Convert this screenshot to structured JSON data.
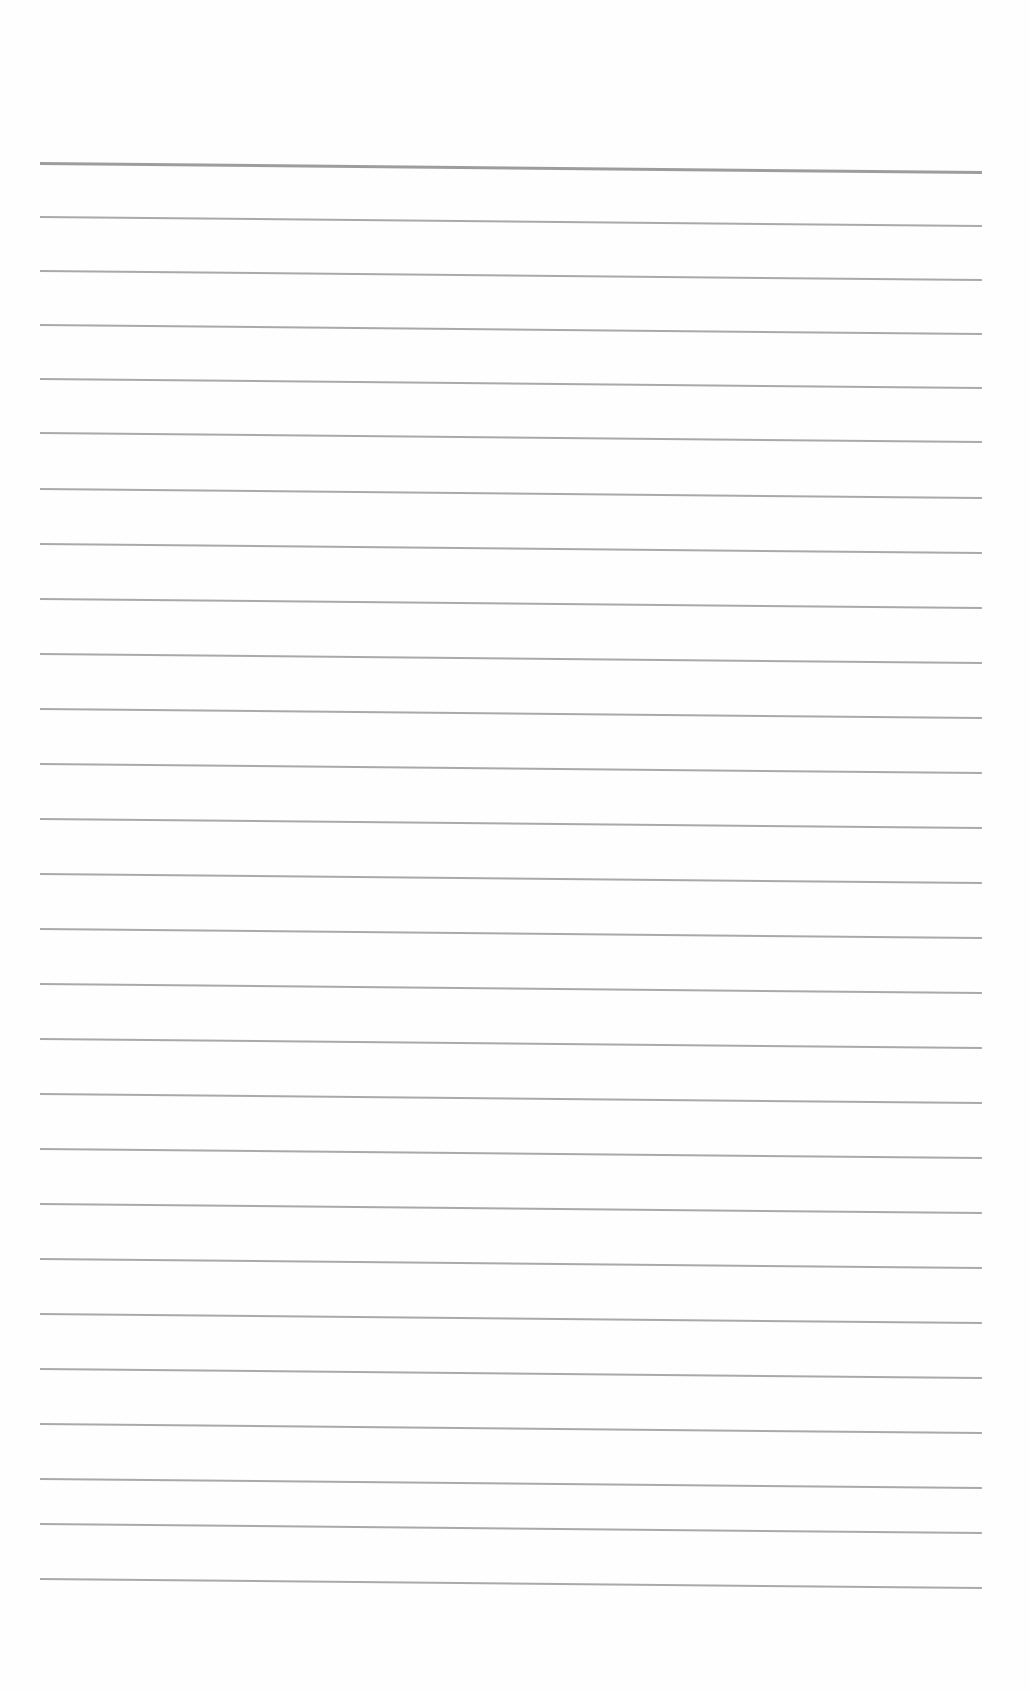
{
  "page": {
    "type": "blank lined paper",
    "background_color": "#fefefe",
    "line_color": "#9a9a9a",
    "line_count": 27,
    "line_y_positions": [
      162,
      216,
      270,
      324,
      378,
      432,
      488,
      543,
      598,
      653,
      708,
      763,
      818,
      873,
      928,
      983,
      1038,
      1093,
      1148,
      1203,
      1258,
      1313,
      1368,
      1423,
      1478,
      1523,
      1578
    ]
  }
}
